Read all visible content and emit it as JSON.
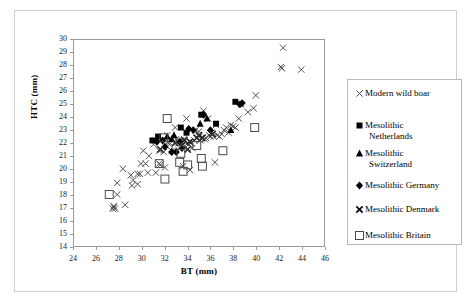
{
  "chart_data": {
    "type": "scatter",
    "title": "",
    "xlabel": "BT (mm)",
    "ylabel": "HTC (mm)",
    "xlim": [
      24,
      46
    ],
    "ylim": [
      14,
      30
    ],
    "xticks": [
      24,
      26,
      28,
      30,
      32,
      34,
      36,
      38,
      40,
      42,
      44,
      46
    ],
    "yticks": [
      14,
      15,
      16,
      17,
      18,
      19,
      20,
      21,
      22,
      23,
      24,
      25,
      26,
      27,
      28,
      29,
      30
    ],
    "grid": false,
    "legend_position": "right",
    "series": [
      {
        "name": "Modern wild boar",
        "marker": "thin-x",
        "color": "#3b3b3b",
        "points": [
          [
            27.4,
            16.9
          ],
          [
            27.6,
            16.9
          ],
          [
            27.5,
            17.0
          ],
          [
            27.5,
            17.1
          ],
          [
            28.5,
            17.2
          ],
          [
            27.8,
            18.0
          ],
          [
            27.8,
            18.9
          ],
          [
            28.3,
            20.0
          ],
          [
            29.0,
            19.5
          ],
          [
            29.2,
            19.1
          ],
          [
            29.1,
            18.7
          ],
          [
            29.6,
            18.8
          ],
          [
            29.6,
            19.6
          ],
          [
            29.9,
            20.4
          ],
          [
            29.8,
            19.6
          ],
          [
            30.3,
            20.4
          ],
          [
            30.5,
            19.7
          ],
          [
            30.6,
            21.0
          ],
          [
            31.0,
            21.9
          ],
          [
            31.5,
            20.4
          ],
          [
            31.6,
            20.3
          ],
          [
            31.5,
            21.4
          ],
          [
            31.9,
            21.3
          ],
          [
            32.0,
            20.1
          ],
          [
            32.1,
            21.8
          ],
          [
            32.3,
            22.1
          ],
          [
            32.4,
            21.9
          ],
          [
            32.2,
            22.6
          ],
          [
            32.6,
            21.4
          ],
          [
            32.8,
            21.4
          ],
          [
            33.0,
            22.3
          ],
          [
            32.9,
            23.2
          ],
          [
            33.2,
            22.0
          ],
          [
            33.4,
            22.2
          ],
          [
            33.5,
            22.0
          ],
          [
            33.7,
            22.3
          ],
          [
            33.9,
            23.9
          ],
          [
            34.0,
            22.0
          ],
          [
            34.1,
            21.9
          ],
          [
            34.3,
            22.0
          ],
          [
            34.4,
            21.6
          ],
          [
            34.6,
            22.2
          ],
          [
            34.7,
            23.0
          ],
          [
            35.0,
            22.9
          ],
          [
            35.1,
            22.2
          ],
          [
            35.2,
            22.3
          ],
          [
            35.4,
            24.5
          ],
          [
            35.5,
            22.3
          ],
          [
            35.6,
            22.4
          ],
          [
            35.8,
            23.9
          ],
          [
            35.9,
            22.6
          ],
          [
            36.0,
            22.5
          ],
          [
            36.1,
            22.8
          ],
          [
            36.3,
            22.5
          ],
          [
            36.4,
            20.5
          ],
          [
            36.5,
            23.4
          ],
          [
            36.6,
            22.6
          ],
          [
            36.8,
            22.5
          ],
          [
            37.0,
            22.7
          ],
          [
            37.2,
            23.0
          ],
          [
            37.4,
            23.2
          ],
          [
            37.6,
            22.8
          ],
          [
            37.8,
            23.4
          ],
          [
            38.0,
            23.3
          ],
          [
            38.2,
            23.2
          ],
          [
            38.5,
            23.9
          ],
          [
            38.7,
            25.0
          ],
          [
            39.3,
            24.4
          ],
          [
            39.8,
            24.7
          ],
          [
            40.0,
            25.7
          ],
          [
            42.2,
            27.9
          ],
          [
            42.3,
            27.8
          ],
          [
            42.4,
            29.4
          ],
          [
            44.0,
            27.7
          ],
          [
            33.6,
            20.2
          ],
          [
            34.2,
            19.9
          ],
          [
            30.1,
            21.4
          ],
          [
            31.2,
            19.7
          ]
        ]
      },
      {
        "name": "Mesolithic Netherlands",
        "marker": "filled-square",
        "color": "#000000",
        "points": [
          [
            30.9,
            22.2
          ],
          [
            31.4,
            22.5
          ],
          [
            33.4,
            23.2
          ],
          [
            35.2,
            24.2
          ],
          [
            36.5,
            23.5
          ],
          [
            38.2,
            25.2
          ],
          [
            33.9,
            22.8
          ]
        ]
      },
      {
        "name": "Mesolithic Switzerland",
        "marker": "filled-triangle",
        "color": "#000000",
        "points": [
          [
            32.2,
            22.5
          ],
          [
            32.8,
            22.6
          ],
          [
            35.1,
            23.5
          ],
          [
            35.7,
            23.9
          ],
          [
            37.8,
            23.0
          ],
          [
            32.6,
            22.3
          ]
        ]
      },
      {
        "name": "Mesolithic Germany",
        "marker": "filled-diamond",
        "color": "#000000",
        "points": [
          [
            31.3,
            22.1
          ],
          [
            32.0,
            21.7
          ],
          [
            32.6,
            21.3
          ],
          [
            33.3,
            22.1
          ],
          [
            33.5,
            21.6
          ],
          [
            34.1,
            23.1
          ],
          [
            34.5,
            23.0
          ],
          [
            35.4,
            24.2
          ],
          [
            36.0,
            23.0
          ],
          [
            38.6,
            25.0
          ],
          [
            38.8,
            25.1
          ],
          [
            31.8,
            22.2
          ],
          [
            33.0,
            21.3
          ]
        ]
      },
      {
        "name": "Mesolithic Denmark",
        "marker": "bold-x",
        "color": "#2b2b2b",
        "points": [
          [
            31.6,
            21.5
          ],
          [
            33.5,
            21.8
          ],
          [
            34.0,
            21.5
          ],
          [
            34.2,
            22.1
          ],
          [
            33.7,
            22.2
          ],
          [
            35.0,
            22.6
          ],
          [
            35.3,
            22.4
          ],
          [
            36.2,
            22.7
          ],
          [
            32.9,
            22.0
          ],
          [
            34.8,
            22.4
          ]
        ]
      },
      {
        "name": "Mesolithic Britain",
        "marker": "open-square",
        "color": "#4a4a4a",
        "points": [
          [
            27.1,
            18.0
          ],
          [
            31.5,
            20.4
          ],
          [
            32.0,
            19.2
          ],
          [
            32.2,
            23.9
          ],
          [
            33.4,
            21.2
          ],
          [
            33.3,
            20.5
          ],
          [
            34.0,
            20.3
          ],
          [
            34.8,
            21.8
          ],
          [
            35.2,
            20.8
          ],
          [
            35.3,
            20.2
          ],
          [
            37.1,
            21.4
          ],
          [
            39.9,
            23.2
          ],
          [
            31.9,
            22.4
          ],
          [
            33.6,
            19.8
          ]
        ]
      }
    ]
  },
  "axes": {
    "y_title": "HTC (mm)",
    "x_title": "BT (mm)"
  },
  "legend": {
    "items": [
      {
        "marker": "thin-x",
        "label": "Modern wild boar",
        "line2": ""
      },
      {
        "marker": "filled-square",
        "label": "Mesolithic",
        "line2": "Netherlands"
      },
      {
        "marker": "filled-triangle",
        "label": "Mesolithic",
        "line2": "Switzerland"
      },
      {
        "marker": "filled-diamond",
        "label": "Mesolithic Germany",
        "line2": ""
      },
      {
        "marker": "bold-x",
        "label": "Mesolithic Denmark",
        "line2": ""
      },
      {
        "marker": "open-square",
        "label": "Mesolithic Britain",
        "line2": ""
      }
    ]
  },
  "colors": {
    "marker_dark": "#000000",
    "marker_grey": "#3b3b3b",
    "axis_line": "#9a9a9a",
    "frame": "#cfcfcf"
  }
}
